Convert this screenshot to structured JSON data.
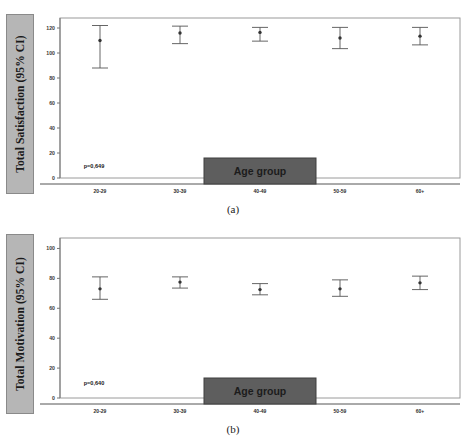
{
  "figure": {
    "panels": [
      {
        "id": "a",
        "caption": "(a)",
        "y_axis_title": "Total Satisfaction (95% CI)",
        "x_axis_box_label": "Age group",
        "p_value_text": "p=0,649"
      },
      {
        "id": "b",
        "caption": "(b)",
        "y_axis_title": "Total Motivation (95% CI)",
        "x_axis_box_label": "Age group",
        "p_value_text": "p=0,640"
      }
    ],
    "colors": {
      "axis_title_box_fill": "#b6b6b6",
      "axis_title_box_border": "#8a8a8a",
      "age_group_box_fill": "#5e5e5e",
      "plot_border": "#9a9a9a",
      "marker": "#333333",
      "errorbar": "#555555"
    }
  },
  "chart_data": [
    {
      "type": "scatter",
      "title": "",
      "panel": "a",
      "xlabel": "Age group",
      "ylabel": "Total Satisfaction (95% CI)",
      "categories": [
        "20-29",
        "30-39",
        "40-49",
        "50-59",
        "60+"
      ],
      "ytick_labels": [
        "0",
        "20",
        "40",
        "60",
        "80",
        "100",
        "120"
      ],
      "yticks": [
        0,
        20,
        40,
        60,
        80,
        100,
        120
      ],
      "ylim": [
        0,
        128
      ],
      "grid": false,
      "legend": "none",
      "annotations": [
        "p=0,649"
      ],
      "series": [
        {
          "name": "Mean with 95% CI",
          "means": [
            110.0,
            116.0,
            116.5,
            112.0,
            113.5
          ],
          "ci_lower": [
            88.0,
            107.5,
            109.5,
            103.5,
            106.5
          ],
          "ci_upper": [
            122.0,
            121.5,
            120.5,
            120.5,
            120.5
          ]
        }
      ]
    },
    {
      "type": "scatter",
      "title": "",
      "panel": "b",
      "xlabel": "Age group",
      "ylabel": "Total Motivation (95% CI)",
      "categories": [
        "20-29",
        "30-39",
        "40-49",
        "50-59",
        "60+"
      ],
      "ytick_labels": [
        "0",
        "20",
        "40",
        "60",
        "80",
        "100"
      ],
      "yticks": [
        0,
        20,
        40,
        60,
        80,
        100
      ],
      "ylim": [
        0,
        107
      ],
      "grid": false,
      "legend": "none",
      "annotations": [
        "p=0,640"
      ],
      "series": [
        {
          "name": "Mean with 95% CI",
          "means": [
            73.0,
            77.5,
            72.5,
            73.0,
            77.0
          ],
          "ci_lower": [
            66.0,
            73.5,
            69.0,
            68.0,
            72.5
          ],
          "ci_upper": [
            81.0,
            81.0,
            76.5,
            79.0,
            81.5
          ]
        }
      ]
    }
  ]
}
